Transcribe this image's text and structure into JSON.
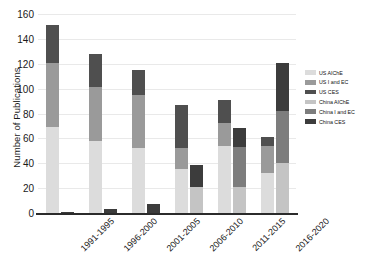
{
  "chart_data": {
    "type": "bar",
    "subtype": "grouped-stacked",
    "title": "",
    "xlabel": "",
    "ylabel": "Number of Publications",
    "categories": [
      "1991-1995",
      "1996-2000",
      "2001-2005",
      "2006-2010",
      "2011-2015",
      "2016-2020"
    ],
    "ylim": [
      0,
      160
    ],
    "yticks": [
      0,
      20,
      40,
      60,
      80,
      100,
      120,
      140,
      160
    ],
    "grid": true,
    "legend_position": "right",
    "series": [
      {
        "name": "US AIChE",
        "color": "#dcdcdc",
        "group": "US",
        "values": [
          69,
          58,
          52,
          35,
          54,
          32
        ]
      },
      {
        "name": "US I and EC",
        "color": "#9a9a9a",
        "group": "US",
        "values": [
          52,
          43,
          43,
          17,
          18,
          22
        ]
      },
      {
        "name": "US CES",
        "color": "#4f4f4f",
        "group": "US",
        "values": [
          30,
          27,
          20,
          35,
          19,
          7
        ]
      },
      {
        "name": "China AIChE",
        "color": "#c4c4c4",
        "group": "China",
        "values": [
          0,
          0,
          0,
          21,
          21,
          40
        ]
      },
      {
        "name": "China I and EC",
        "color": "#7d7d7d",
        "group": "China",
        "values": [
          0,
          0,
          0,
          0,
          32,
          42
        ]
      },
      {
        "name": "China CES",
        "color": "#3c3c3c",
        "group": "China",
        "values": [
          1,
          3,
          7,
          18,
          15,
          39
        ]
      }
    ],
    "totals": {
      "US": [
        151,
        128,
        115,
        87,
        91,
        61
      ],
      "China": [
        1,
        3,
        7,
        39,
        68,
        121
      ]
    }
  },
  "legend": {
    "items": [
      {
        "label": "US AIChE"
      },
      {
        "label": "US I and EC"
      },
      {
        "label": "US CES"
      },
      {
        "label": "China AIChE"
      },
      {
        "label": "China I and EC"
      },
      {
        "label": "China CES"
      }
    ]
  }
}
